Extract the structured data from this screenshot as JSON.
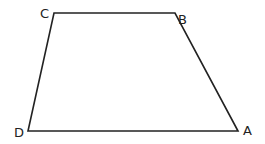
{
  "diagram": {
    "type": "quadrilateral",
    "stroke_color": "#222222",
    "vertices": [
      {
        "label": "A",
        "x": 238,
        "y": 131
      },
      {
        "label": "B",
        "x": 175,
        "y": 13
      },
      {
        "label": "C",
        "x": 54,
        "y": 13
      },
      {
        "label": "D",
        "x": 28,
        "y": 131
      }
    ]
  }
}
